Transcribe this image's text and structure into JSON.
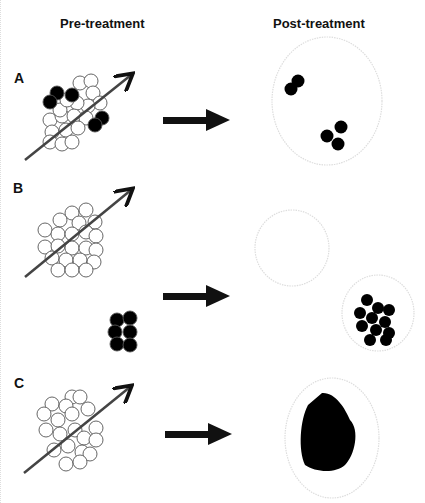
{
  "headers": {
    "pre": "Pre-treatment",
    "post": "Post-treatment"
  },
  "panels": [
    {
      "label": "A",
      "description": "Heterogeneous tumor with few resistant (black) cells; after treatment only resistant cells remain"
    },
    {
      "label": "B",
      "description": "Sensitive tumor eliminated; separate resistant clone grows after treatment"
    },
    {
      "label": "C",
      "description": "All-sensitive tumor; resistant tumor emerges after treatment"
    }
  ],
  "colors": {
    "sensitive_cell": "#ffffff",
    "resistant_cell": "#000000",
    "outline": "#555555",
    "container": "#dddddd",
    "arrow": "#111111"
  }
}
